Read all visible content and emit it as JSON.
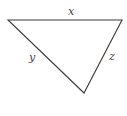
{
  "diagram": {
    "type": "triangle",
    "stroke_color": "#3a3a3a",
    "vertices": {
      "left": [
        8,
        20
      ],
      "right": [
        122,
        20
      ],
      "bottom": [
        84,
        93
      ]
    },
    "sides": [
      {
        "label": "x",
        "from": "left",
        "to": "right",
        "label_pos": [
          71,
          15
        ]
      },
      {
        "label": "y",
        "from": "left",
        "to": "bottom",
        "label_pos": [
          32,
          61
        ]
      },
      {
        "label": "z",
        "from": "right",
        "to": "bottom",
        "label_pos": [
          111,
          60
        ]
      }
    ]
  }
}
